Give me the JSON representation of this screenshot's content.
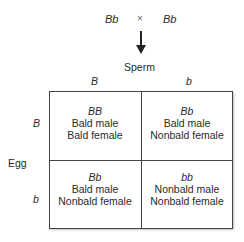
{
  "cross": {
    "parent1": "Bb",
    "symbol": "×",
    "parent2": "Bb"
  },
  "axes": {
    "column_header": "Sperm",
    "row_header": "Egg",
    "columns": [
      "B",
      "b"
    ],
    "rows": [
      "B",
      "b"
    ]
  },
  "cells": [
    {
      "genotype": "BB",
      "male": "Bald male",
      "female": "Bald female"
    },
    {
      "genotype": "Bb",
      "male": "Bald male",
      "female": "Nonbald female"
    },
    {
      "genotype": "Bb",
      "male": "Bald male",
      "female": "Nonbald female"
    },
    {
      "genotype": "bb",
      "male": "Nonbald male",
      "female": "Nonbald female"
    }
  ]
}
